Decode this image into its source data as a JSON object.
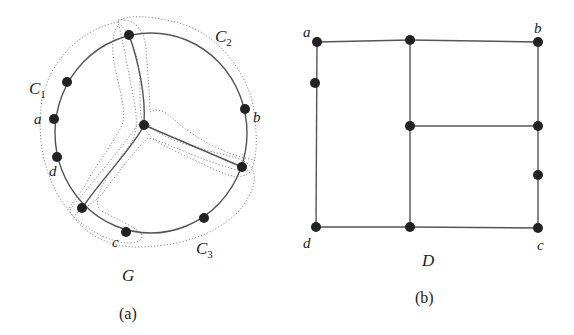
{
  "figure_a": {
    "caption": "(a)",
    "graph_label": "G",
    "cycle_labels": {
      "c1": "C",
      "c1_sub": "1",
      "c2": "C",
      "c2_sub": "2",
      "c3": "C",
      "c3_sub": "3"
    },
    "vertex_labels": {
      "a": "a",
      "b": "b",
      "c": "c",
      "d": "d"
    },
    "nodes": [
      {
        "id": "top",
        "x": 129,
        "y": 35
      },
      {
        "id": "n_c1",
        "x": 67,
        "y": 82
      },
      {
        "id": "a",
        "x": 54,
        "y": 119
      },
      {
        "id": "d",
        "x": 57,
        "y": 157
      },
      {
        "id": "bl",
        "x": 82,
        "y": 208
      },
      {
        "id": "c",
        "x": 126,
        "y": 232
      },
      {
        "id": "n_c3",
        "x": 204,
        "y": 218
      },
      {
        "id": "br",
        "x": 242,
        "y": 167
      },
      {
        "id": "b",
        "x": 245,
        "y": 109
      },
      {
        "id": "center",
        "x": 144,
        "y": 125
      }
    ]
  },
  "figure_b": {
    "caption": "(b)",
    "graph_label": "D",
    "vertex_labels": {
      "a": "a",
      "b": "b",
      "c": "c",
      "d": "d"
    },
    "nodes": [
      {
        "id": "a",
        "x": 317,
        "y": 42
      },
      {
        "id": "top_mid",
        "x": 410,
        "y": 40
      },
      {
        "id": "b",
        "x": 538,
        "y": 42
      },
      {
        "id": "left_mid",
        "x": 315,
        "y": 83
      },
      {
        "id": "mid_mid",
        "x": 410,
        "y": 126
      },
      {
        "id": "right_mid",
        "x": 538,
        "y": 126
      },
      {
        "id": "right_low",
        "x": 538,
        "y": 175
      },
      {
        "id": "d",
        "x": 316,
        "y": 227
      },
      {
        "id": "bot_mid",
        "x": 410,
        "y": 227
      },
      {
        "id": "c",
        "x": 538,
        "y": 228
      }
    ]
  }
}
